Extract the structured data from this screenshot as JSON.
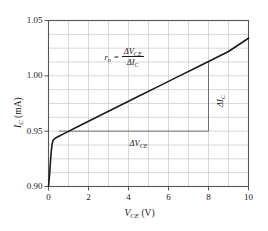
{
  "chart_data": {
    "type": "line",
    "title": "",
    "xlabel": "V_CE (V)",
    "ylabel": "I_C (mA)",
    "xlabel_main": "V",
    "xlabel_sub": "CE",
    "xlabel_unit": "(V)",
    "ylabel_main": "I",
    "ylabel_sub": "C",
    "ylabel_unit": "(mA)",
    "xlim": [
      0,
      10
    ],
    "ylim": [
      0.9,
      1.05
    ],
    "xticks": [
      0,
      2,
      4,
      6,
      8,
      10
    ],
    "xtick_labels": [
      "0",
      "2",
      "4",
      "6",
      "8",
      "10"
    ],
    "yticks": [
      0.9,
      0.95,
      1.0,
      1.05
    ],
    "ytick_labels": [
      "0.90",
      "0.95",
      "1.00",
      "1.05"
    ],
    "x_gridlines": [
      1,
      2,
      3,
      4,
      5,
      6,
      7,
      8,
      9
    ],
    "y_gridlines": [
      0.9125,
      0.925,
      0.9375,
      0.95,
      0.9625,
      0.975,
      0.9875,
      1.0,
      1.0125,
      1.025,
      1.0375
    ],
    "grid": true,
    "legend": "none",
    "series": [
      {
        "name": "collector-characteristic",
        "color": "#1a1a1a",
        "linewidth": 1.6,
        "points": [
          [
            0.0,
            0.9
          ],
          [
            0.06,
            0.912
          ],
          [
            0.1,
            0.923
          ],
          [
            0.14,
            0.932
          ],
          [
            0.18,
            0.9385
          ],
          [
            0.23,
            0.9418
          ],
          [
            0.3,
            0.9432
          ],
          [
            0.45,
            0.9448
          ],
          [
            0.8,
            0.948
          ],
          [
            1.5,
            0.9545
          ],
          [
            2.5,
            0.9635
          ],
          [
            3.5,
            0.9725
          ],
          [
            4.5,
            0.9815
          ],
          [
            5.5,
            0.9905
          ],
          [
            6.5,
            0.9995
          ],
          [
            7.5,
            1.0085
          ],
          [
            8.0,
            1.013
          ],
          [
            9.0,
            1.022
          ],
          [
            10.0,
            1.034
          ]
        ]
      }
    ],
    "annotations": [
      {
        "name": "formula",
        "lhs": "r",
        "lhs_sub": "o",
        "equals": "=",
        "numerator": "ΔV",
        "numerator_sub": "CE",
        "denominator": "ΔI",
        "denominator_sub": "C",
        "x": 3.1,
        "y": 1.018
      },
      {
        "name": "delta-vce-label",
        "text": "ΔV",
        "sub": "CE",
        "x": 4.6,
        "y": 0.9385
      },
      {
        "name": "delta-ic-label",
        "text": "ΔI",
        "sub": "C",
        "x": 8.55,
        "y": 0.9815,
        "rotation": -90
      }
    ],
    "construction_lines": [
      {
        "name": "delta-vce-line",
        "orientation": "horizontal",
        "y": 0.95,
        "x_start": 0.52,
        "x_end": 8.0,
        "color": "#555555",
        "linewidth": 0.8
      },
      {
        "name": "delta-ic-line",
        "orientation": "vertical",
        "x": 8.0,
        "y_start": 0.95,
        "y_end": 1.013,
        "color": "#555555",
        "linewidth": 0.8
      }
    ],
    "colors": {
      "axis": "#555555",
      "grid": "#c9c9c9",
      "curve": "#1a1a1a",
      "construction": "#555555",
      "background": "#ffffff",
      "text": "#1a1a1a"
    }
  }
}
